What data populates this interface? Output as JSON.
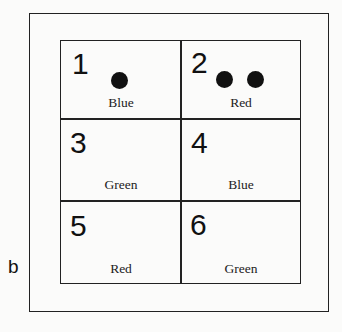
{
  "figure": {
    "panel_label": "b",
    "caption_fragment": ""
  },
  "cells": [
    {
      "number": "1",
      "color_label": "Blue",
      "dots": 1
    },
    {
      "number": "2",
      "color_label": "Red",
      "dots": 2
    },
    {
      "number": "3",
      "color_label": "Green",
      "dots": 0
    },
    {
      "number": "4",
      "color_label": "Blue",
      "dots": 0
    },
    {
      "number": "5",
      "color_label": "Red",
      "dots": 0
    },
    {
      "number": "6",
      "color_label": "Green",
      "dots": 0
    }
  ]
}
